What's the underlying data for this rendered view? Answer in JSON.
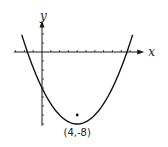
{
  "chart_data": {
    "type": "line",
    "title": "",
    "function": "y = 0.25(x - 4)^2 - 8",
    "xlabel": "x",
    "ylabel": "y",
    "xlim": [
      -3.2,
      11.5
    ],
    "ylim": [
      -8.2,
      2.5
    ],
    "x_tick_step": 1,
    "y_tick_step": 1,
    "grid": false,
    "series": [
      {
        "name": "parabola",
        "vertex": [
          4,
          -8
        ],
        "a": 0.25,
        "x_range": [
          -2.3,
          10.3
        ]
      }
    ],
    "annotations": [
      {
        "text": "(4,-8)",
        "x": 4,
        "y": -8,
        "position": "below"
      }
    ],
    "marker_point": [
      4,
      -7
    ]
  }
}
